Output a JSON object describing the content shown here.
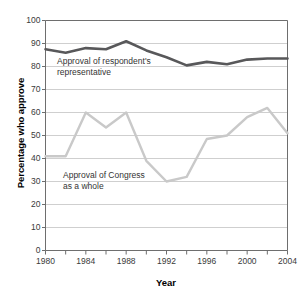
{
  "chart_data": {
    "type": "line",
    "title": "",
    "xlabel": "Year",
    "ylabel": "Percentage who approve",
    "xlim": [
      1980,
      2004
    ],
    "ylim": [
      0,
      100
    ],
    "grid": true,
    "legend_position": "inline-annotations",
    "x": [
      1980,
      1982,
      1984,
      1986,
      1988,
      1990,
      1992,
      1994,
      1996,
      1998,
      2000,
      2002,
      2004
    ],
    "xticks": [
      1980,
      1982,
      1984,
      1986,
      1988,
      1990,
      1992,
      1994,
      1996,
      1998,
      2000,
      2002,
      2004
    ],
    "xtick_labels": [
      "1980",
      "",
      "1984",
      "",
      "1988",
      "",
      "1992",
      "",
      "1996",
      "",
      "2000",
      "",
      "2004"
    ],
    "xtick_labels_shown": [
      "1980",
      "1984",
      "1988",
      "1992",
      "1996",
      "2000",
      "2004"
    ],
    "yticks": [
      0,
      10,
      20,
      30,
      40,
      50,
      60,
      70,
      80,
      90,
      100
    ],
    "ytick_labels": [
      "0",
      "10",
      "20",
      "30",
      "40",
      "50",
      "60",
      "70",
      "80",
      "90",
      "100"
    ],
    "series": [
      {
        "name": "Approval of respondent's representative",
        "color": "#58585a",
        "values": [
          87.5,
          86.0,
          88.0,
          87.5,
          91.0,
          87.0,
          84.0,
          80.5,
          82.0,
          81.0,
          83.0,
          83.5,
          83.5
        ]
      },
      {
        "name": "Approval of Congress as a whole",
        "color": "#c9c9c9",
        "values": [
          41.0,
          41.0,
          60.0,
          53.5,
          60.0,
          39.0,
          30.0,
          32.0,
          48.5,
          50.0,
          58.0,
          62.0,
          51.0
        ]
      }
    ],
    "annotations": [
      {
        "id": "representative",
        "line1": "Approval of respondent's",
        "line2": "representative"
      },
      {
        "id": "congress",
        "line1": "Approval of Congress",
        "line2": "as a whole"
      }
    ]
  },
  "axes": {
    "ylabel": "Percentage who approve",
    "xlabel": "Year"
  },
  "colors": {
    "series_representative": "#58585a",
    "series_congress": "#c9c9c9",
    "gridline": "#cfcfcf",
    "axis": "#6e6e6e",
    "background": "#ffffff",
    "text": "#333333"
  }
}
